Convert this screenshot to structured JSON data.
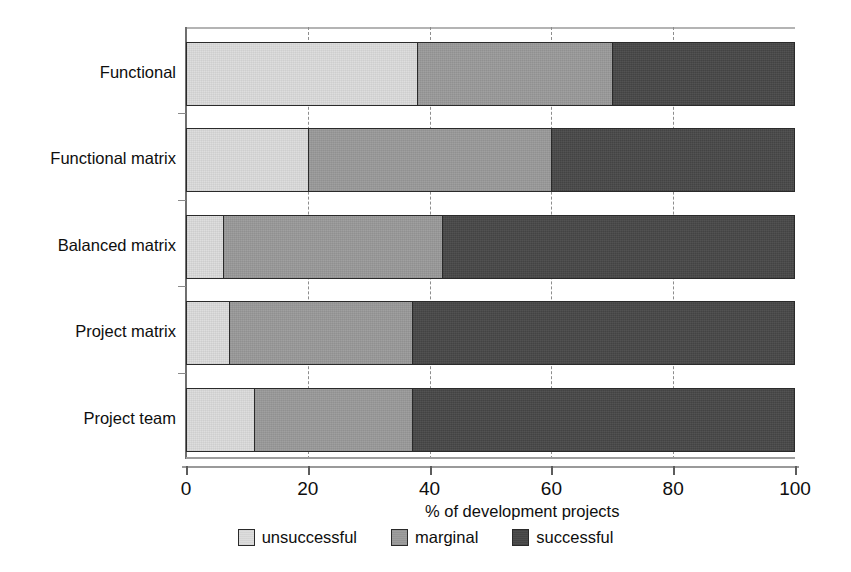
{
  "chart_data": {
    "type": "bar",
    "orientation": "horizontal",
    "stacked": true,
    "normalized_percent": true,
    "title": "",
    "xlabel": "% of development projects",
    "ylabel": "",
    "xlim": [
      0,
      100
    ],
    "xticks": [
      0,
      20,
      40,
      60,
      80,
      100
    ],
    "xtick_labels": [
      "0",
      "20",
      "40",
      "60",
      "80",
      "100"
    ],
    "grid": "vertical-dashed",
    "legend_position": "bottom-center",
    "categories": [
      "Functional",
      "Functional matrix",
      "Balanced matrix",
      "Project matrix",
      "Project team"
    ],
    "series": [
      {
        "name": "unsuccessful",
        "color": "#dcdcdc",
        "values": [
          38,
          20,
          6,
          7,
          11
        ]
      },
      {
        "name": "marginal",
        "color": "#9a9a9a",
        "values": [
          32,
          40,
          36,
          30,
          26
        ]
      },
      {
        "name": "successful",
        "color": "#474747",
        "values": [
          30,
          40,
          58,
          63,
          63
        ]
      }
    ],
    "cumulative_boundaries": [
      [
        38,
        70
      ],
      [
        20,
        60
      ],
      [
        6,
        42
      ],
      [
        7,
        37
      ],
      [
        11,
        37
      ]
    ]
  },
  "axis": {
    "x_title": "% of development projects",
    "tick_labels": [
      "0",
      "20",
      "40",
      "60",
      "80",
      "100"
    ]
  },
  "legend": {
    "items": [
      {
        "label": "unsuccessful",
        "color": "#dcdcdc"
      },
      {
        "label": "marginal",
        "color": "#9a9a9a"
      },
      {
        "label": "successful",
        "color": "#474747"
      }
    ]
  },
  "colors": {
    "unsuccessful": "#dcdcdc",
    "marginal": "#9a9a9a",
    "successful": "#474747",
    "outline": "#2a2a2a",
    "grid": "#8d8d8d",
    "text": "#0e0e0e",
    "background": "#ffffff"
  }
}
